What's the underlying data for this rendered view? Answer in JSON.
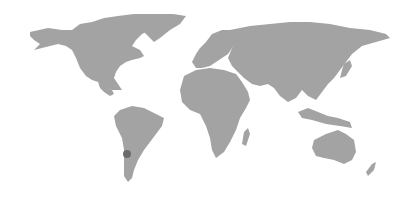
{
  "map": {
    "type": "world-choropleth",
    "land_color": "#a3a3a3",
    "background_color": "#ffffff",
    "highlight_color": "#6b6b6b",
    "highlighted_regions": [
      {
        "name": "Chile",
        "label": ""
      }
    ]
  }
}
